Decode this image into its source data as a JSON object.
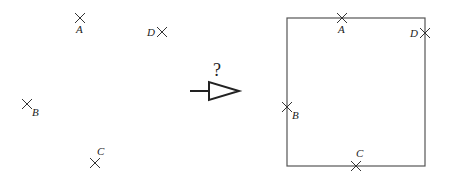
{
  "diagram": {
    "question_mark": "?",
    "colors": {
      "stroke": "#333333",
      "box": "#555555"
    },
    "left_points": [
      {
        "label": "A",
        "x": 80,
        "y": 18,
        "lx": 76,
        "ly": 33
      },
      {
        "label": "D",
        "x": 162,
        "y": 32,
        "lx": 147,
        "ly": 36
      },
      {
        "label": "B",
        "x": 27,
        "y": 104,
        "lx": 32,
        "ly": 116
      },
      {
        "label": "C",
        "x": 95,
        "y": 163,
        "lx": 97,
        "ly": 155
      }
    ],
    "square": {
      "x": 287,
      "y": 18,
      "w": 138,
      "h": 148
    },
    "right_points": [
      {
        "label": "A",
        "x": 342,
        "y": 18,
        "lx": 338,
        "ly": 33
      },
      {
        "label": "D",
        "x": 425,
        "y": 33,
        "lx": 410,
        "ly": 37
      },
      {
        "label": "B",
        "x": 287,
        "y": 107,
        "lx": 292,
        "ly": 119
      },
      {
        "label": "C",
        "x": 356,
        "y": 166,
        "lx": 356,
        "ly": 157
      }
    ]
  }
}
